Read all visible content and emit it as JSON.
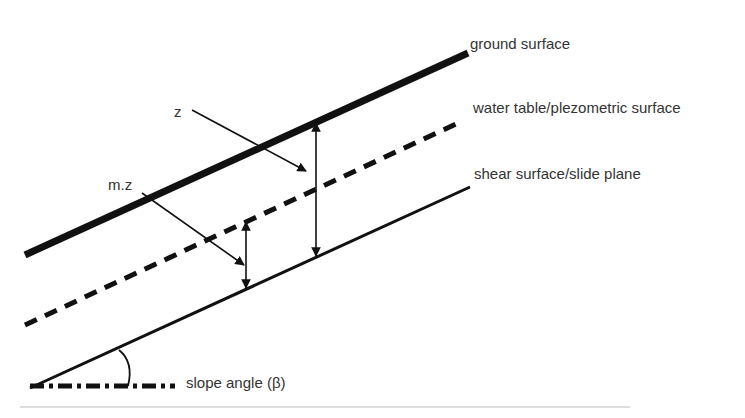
{
  "diagram": {
    "type": "infinite slope cross-section",
    "labels": {
      "ground_surface": "ground surface",
      "water_table": "water table/plezometric surface",
      "shear_surface": "shear surface/slide plane",
      "z": "z",
      "mz": "m.z",
      "slope_angle": "slope angle (β)"
    },
    "colors": {
      "line": "#111111",
      "text": "#333333",
      "rule": "#bbbbbb"
    },
    "lines": [
      {
        "name": "ground-surface",
        "style": "solid",
        "width": 7,
        "from": [
          25,
          255
        ],
        "to": [
          468,
          53
        ]
      },
      {
        "name": "water-table",
        "style": "dashed",
        "width": 5,
        "from": [
          25,
          325
        ],
        "to": [
          458,
          123
        ]
      },
      {
        "name": "shear-surface",
        "style": "solid",
        "width": 3,
        "from": [
          30,
          388
        ],
        "to": [
          470,
          187
        ]
      }
    ]
  }
}
